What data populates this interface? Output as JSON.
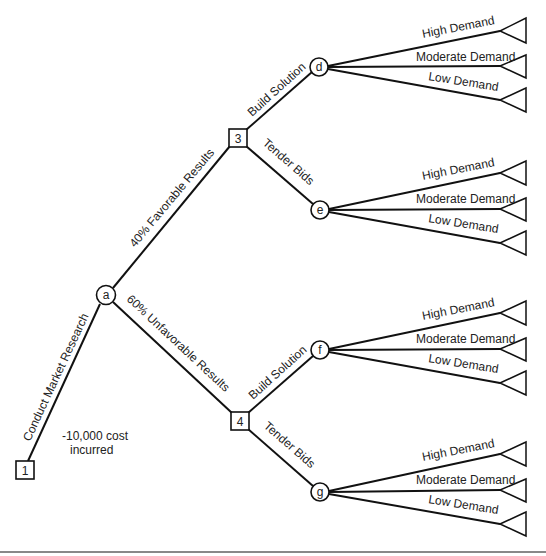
{
  "diagram": {
    "type": "decision-tree",
    "nodes": [
      {
        "id": "1",
        "shape": "square",
        "label": "1",
        "x": 25,
        "y": 470
      },
      {
        "id": "a",
        "shape": "circle",
        "label": "a",
        "x": 106,
        "y": 295
      },
      {
        "id": "3",
        "shape": "square",
        "label": "3",
        "x": 238,
        "y": 138
      },
      {
        "id": "4",
        "shape": "square",
        "label": "4",
        "x": 240,
        "y": 421
      },
      {
        "id": "d",
        "shape": "circle",
        "label": "d",
        "x": 319,
        "y": 67
      },
      {
        "id": "e",
        "shape": "circle",
        "label": "e",
        "x": 320,
        "y": 210
      },
      {
        "id": "f",
        "shape": "circle",
        "label": "f",
        "x": 320,
        "y": 350
      },
      {
        "id": "g",
        "shape": "circle",
        "label": "g",
        "x": 320,
        "y": 492
      }
    ],
    "edges": [
      {
        "from": "1",
        "to": "a",
        "label": "Conduct Market Research"
      },
      {
        "from": "a",
        "to": "3",
        "label": "40% Favorable Results"
      },
      {
        "from": "a",
        "to": "4",
        "label": "60% Unfavorable Results"
      },
      {
        "from": "3",
        "to": "d",
        "label": "Build Solution"
      },
      {
        "from": "3",
        "to": "e",
        "label": "Tender Bids"
      },
      {
        "from": "4",
        "to": "f",
        "label": "Build Solution"
      },
      {
        "from": "4",
        "to": "g",
        "label": "Tender Bids"
      }
    ],
    "annotation": {
      "line1": "-10,000 cost",
      "line2": "incurred"
    },
    "outcome_labels": {
      "high": "High Demand",
      "moderate": "Moderate Demand",
      "low": "Low Demand"
    },
    "chance_outcomes": [
      {
        "node": "d",
        "tips": [
          31,
          66,
          100
        ]
      },
      {
        "node": "e",
        "tips": [
          173,
          209,
          243
        ]
      },
      {
        "node": "f",
        "tips": [
          313,
          349,
          383
        ]
      },
      {
        "node": "g",
        "tips": [
          454,
          490,
          524
        ]
      }
    ]
  }
}
